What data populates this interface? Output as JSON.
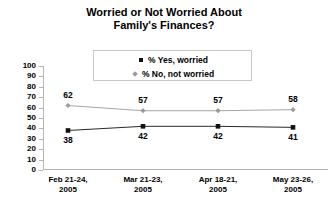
{
  "chart_data": {
    "type": "line",
    "title": "Worried or Not Worried About Family's Finances?",
    "title_line1": "Worried or Not Worried About",
    "title_line2": "Family's Finances?",
    "xlabel": "",
    "ylabel": "",
    "ylim": [
      0,
      100
    ],
    "ytick_step": 10,
    "yticks": [
      "100",
      "90",
      "80",
      "70",
      "60",
      "50",
      "40",
      "30",
      "20",
      "10",
      "0"
    ],
    "grid": false,
    "legend_position": "top-center",
    "categories": [
      "Feb 21-24, 2005",
      "Mar 21-23, 2005",
      "Apr 18-21, 2005",
      "May 23-26, 2005"
    ],
    "categories_split": [
      {
        "range": "Feb 21-24,",
        "year": "2005"
      },
      {
        "range": "Mar 21-23,",
        "year": "2005"
      },
      {
        "range": "Apr 18-21,",
        "year": "2005"
      },
      {
        "range": "May 23-26,",
        "year": "2005"
      }
    ],
    "series": [
      {
        "name": "% Yes, worried",
        "marker": "square",
        "color": "#111111",
        "label_position": "below",
        "values": [
          38,
          42,
          42,
          41
        ]
      },
      {
        "name": "% No, not worried",
        "marker": "diamond",
        "color": "#9b9b9b",
        "label_position": "above",
        "values": [
          62,
          57,
          57,
          58
        ]
      }
    ]
  },
  "legend": {
    "items": [
      {
        "label": "% Yes, worried",
        "marker": "square"
      },
      {
        "label": "% No, not worried",
        "marker": "diamond"
      }
    ]
  },
  "colors": {
    "yes_series": "#111111",
    "no_series": "#9b9b9b",
    "axis": "#b4b4b4",
    "legend_border": "#c8c8c8",
    "background": "#ffffff",
    "text": "#000000"
  }
}
